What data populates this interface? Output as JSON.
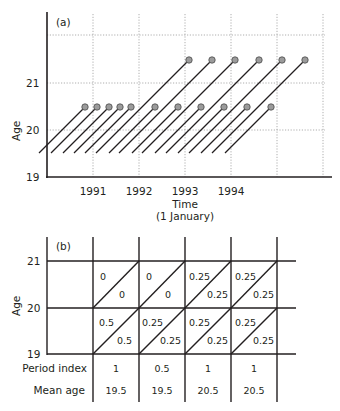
{
  "panel_a": {
    "label": "(a)",
    "ylabel": "Age",
    "xlabel": "Time",
    "xlabel_sub": "(1 January)",
    "y_ticks": [
      "21",
      "20",
      "19"
    ],
    "x_ticks": [
      "1991",
      "1992",
      "1993",
      "1994"
    ],
    "lifelines_short": {
      "description": "Lifelines ending at age 20.5 (dots)",
      "count": 11
    },
    "lifelines_long": {
      "description": "Lifelines ending at age 21.5 (dots)",
      "count": 6
    }
  },
  "panel_b": {
    "label": "(b)",
    "ylabel": "Age",
    "y_ticks": [
      "21",
      "20",
      "19"
    ],
    "rows": [
      {
        "age_range": "20-21",
        "cells": [
          {
            "upper": "0",
            "lower": "0"
          },
          {
            "upper": "0",
            "lower": "0"
          },
          {
            "upper": "0.25",
            "lower": "0.25"
          },
          {
            "upper": "0.25",
            "lower": "0.25"
          }
        ]
      },
      {
        "age_range": "19-20",
        "cells": [
          {
            "upper": "0.5",
            "lower": "0.5"
          },
          {
            "upper": "0.25",
            "lower": "0.25"
          },
          {
            "upper": "0.25",
            "lower": "0.25"
          },
          {
            "upper": "0.25",
            "lower": "0.25"
          }
        ]
      }
    ],
    "period_index_label": "Period index",
    "period_index": [
      "1",
      "0.5",
      "1",
      "1"
    ],
    "mean_age_label": "Mean age",
    "mean_age": [
      "19.5",
      "19.5",
      "20.5",
      "20.5"
    ]
  }
}
